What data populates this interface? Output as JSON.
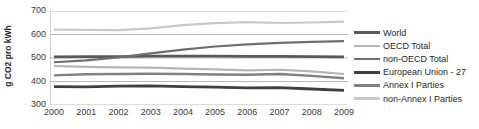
{
  "chart_data": {
    "type": "line",
    "title": "",
    "xlabel": "",
    "ylabel": "g CO2 pro kWh",
    "x": [
      2000,
      2001,
      2002,
      2003,
      2004,
      2005,
      2006,
      2007,
      2008,
      2009
    ],
    "xtick_labels": [
      "2000",
      "2001",
      "2002",
      "2003",
      "2004",
      "2005",
      "2006",
      "2007",
      "2008",
      "2009"
    ],
    "ytick_labels": [
      "300",
      "400",
      "500",
      "600",
      "700"
    ],
    "yticks": [
      300,
      400,
      500,
      600,
      700
    ],
    "ylim": [
      300,
      700
    ],
    "grid": "horizontal",
    "legend_position": "right",
    "series": [
      {
        "name": "World",
        "color": "#595959",
        "width": 2.6,
        "values": [
          505,
          506,
          506,
          508,
          508,
          508,
          507,
          507,
          506,
          505
        ]
      },
      {
        "name": "OECD Total",
        "color": "#b5b5b5",
        "width": 2.2,
        "values": [
          466,
          462,
          460,
          459,
          455,
          452,
          447,
          450,
          443,
          432
        ]
      },
      {
        "name": "non-OECD Total",
        "color": "#6e6e6e",
        "width": 2.2,
        "values": [
          482,
          490,
          503,
          520,
          536,
          549,
          558,
          564,
          569,
          572
        ]
      },
      {
        "name": "European Union - 27",
        "color": "#3f3f3f",
        "width": 2.8,
        "values": [
          378,
          377,
          380,
          381,
          378,
          376,
          373,
          374,
          368,
          362
        ]
      },
      {
        "name": "Annex I Parties",
        "color": "#808080",
        "width": 2.4,
        "values": [
          426,
          431,
          432,
          433,
          432,
          430,
          429,
          432,
          424,
          414
        ]
      },
      {
        "name": "non-Annex I Parties",
        "color": "#c9c9c9",
        "width": 2.2,
        "values": [
          621,
          620,
          619,
          626,
          640,
          648,
          653,
          649,
          651,
          655
        ]
      }
    ]
  },
  "legend": {
    "items": [
      {
        "label": "World"
      },
      {
        "label": "OECD Total"
      },
      {
        "label": "non-OECD Total"
      },
      {
        "label": "European Union - 27"
      },
      {
        "label": "Annex I Parties"
      },
      {
        "label": "non-Annex I Parties"
      }
    ]
  },
  "axes": {
    "y_title": "g CO2 pro kWh"
  },
  "colors": {
    "gridline": "#b0b0b0",
    "axis": "#9a9a9a",
    "text": "#3a3a3a"
  }
}
